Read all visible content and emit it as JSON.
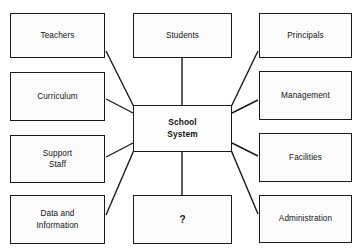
{
  "diagram": {
    "type": "concept-map",
    "center": {
      "id": "school-system",
      "label": "School\nSystem",
      "x": 133,
      "y": 105,
      "width": 99,
      "height": 47,
      "bold": true
    },
    "nodes": [
      {
        "id": "teachers",
        "label": "Teachers",
        "x": 10,
        "y": 13,
        "width": 95,
        "height": 45
      },
      {
        "id": "students",
        "label": "Students",
        "x": 133,
        "y": 13,
        "width": 99,
        "height": 45
      },
      {
        "id": "principals",
        "label": "Principals",
        "x": 259,
        "y": 13,
        "width": 93,
        "height": 45
      },
      {
        "id": "curriculum",
        "label": "Curriculum",
        "x": 10,
        "y": 72,
        "width": 95,
        "height": 49
      },
      {
        "id": "management",
        "label": "Management",
        "x": 259,
        "y": 71,
        "width": 93,
        "height": 49
      },
      {
        "id": "support-staff",
        "label": "Support\nStaff",
        "x": 10,
        "y": 135,
        "width": 95,
        "height": 48
      },
      {
        "id": "facilities",
        "label": "Facilities",
        "x": 259,
        "y": 133,
        "width": 93,
        "height": 49
      },
      {
        "id": "data-and-information",
        "label": "Data and\nInformation",
        "x": 10,
        "y": 195,
        "width": 95,
        "height": 49
      },
      {
        "id": "question",
        "label": "?",
        "x": 133,
        "y": 195,
        "width": 99,
        "height": 49
      },
      {
        "id": "administration",
        "label": "Administration",
        "x": 259,
        "y": 195,
        "width": 93,
        "height": 48
      }
    ],
    "connectors": [
      {
        "from": "school-system",
        "to": "teachers",
        "x1": 134,
        "y1": 107,
        "x2": 106,
        "y2": 51
      },
      {
        "from": "school-system",
        "to": "students",
        "x1": 182,
        "y1": 105,
        "x2": 182,
        "y2": 58
      },
      {
        "from": "school-system",
        "to": "principals",
        "x1": 231,
        "y1": 107,
        "x2": 258,
        "y2": 51
      },
      {
        "from": "school-system",
        "to": "curriculum",
        "x1": 133,
        "y1": 113,
        "x2": 106,
        "y2": 99
      },
      {
        "from": "school-system",
        "to": "management",
        "x1": 232,
        "y1": 113,
        "x2": 258,
        "y2": 100
      },
      {
        "from": "school-system",
        "to": "support-staff",
        "x1": 133,
        "y1": 143,
        "x2": 106,
        "y2": 157
      },
      {
        "from": "school-system",
        "to": "facilities",
        "x1": 232,
        "y1": 143,
        "x2": 258,
        "y2": 156
      },
      {
        "from": "school-system",
        "to": "data-and-information",
        "x1": 134,
        "y1": 150,
        "x2": 106,
        "y2": 215
      },
      {
        "from": "school-system",
        "to": "question",
        "x1": 182,
        "y1": 152,
        "x2": 182,
        "y2": 195
      },
      {
        "from": "school-system",
        "to": "administration",
        "x1": 231,
        "y1": 150,
        "x2": 258,
        "y2": 214
      }
    ],
    "style": {
      "stroke_color": "#1a1a1a",
      "stroke_width": 1.4,
      "box_fill": "#fbfbfb",
      "background": "#ffffff",
      "text_color": "#141414"
    }
  }
}
